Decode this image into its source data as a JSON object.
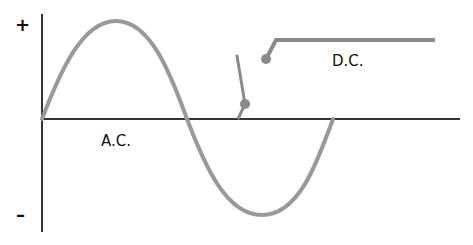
{
  "diagram": {
    "title": "",
    "labels": {
      "plus": "+",
      "minus": "–",
      "ac": "A.C.",
      "dc": "D.C."
    },
    "colors": {
      "axis": "#333333",
      "wave": "#999999",
      "switch": "#8a8a8a",
      "text": "#111111",
      "background": "#ffffff"
    },
    "elements": [
      {
        "id": "y-axis",
        "kind": "axis",
        "from": [
          42,
          14
        ],
        "to": [
          42,
          232
        ]
      },
      {
        "id": "x-axis",
        "kind": "axis",
        "from": [
          42,
          119
        ],
        "to": [
          460,
          119
        ]
      },
      {
        "id": "ac-wave",
        "kind": "sine-curve",
        "start": [
          42,
          119
        ],
        "peak": [
          116,
          21
        ],
        "mid_zero": [
          187,
          119
        ],
        "trough": [
          262,
          215
        ],
        "end": [
          333,
          119
        ]
      },
      {
        "id": "switch-lever",
        "kind": "line",
        "from": [
          237,
          56
        ],
        "to": [
          245,
          104
        ]
      },
      {
        "id": "switch-pivot",
        "kind": "dot",
        "at": [
          245,
          104
        ]
      },
      {
        "id": "dc-contact",
        "kind": "dot",
        "at": [
          266,
          59
        ]
      },
      {
        "id": "dc-line",
        "kind": "polyline",
        "points": [
          [
            266,
            59
          ],
          [
            276,
            40
          ],
          [
            435,
            40
          ]
        ]
      }
    ]
  }
}
